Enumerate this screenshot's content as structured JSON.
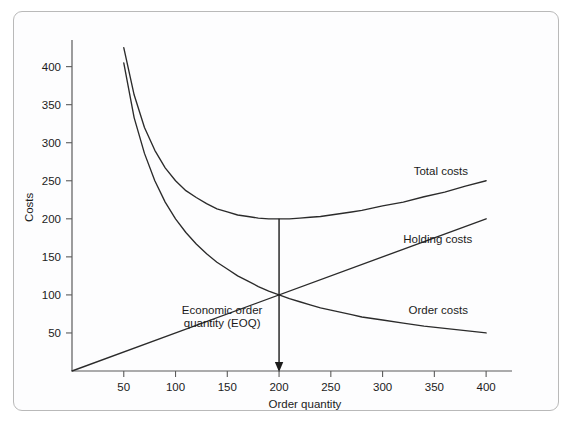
{
  "figure": {
    "frame_color": "#b9b9b9",
    "background": "#fdfdfe",
    "line_color": "#2b2b2b",
    "axis_color": "#5b5b5b"
  },
  "chart_data": {
    "type": "line",
    "title": "",
    "xlabel": "Order quantity",
    "ylabel": "Costs",
    "xlim": [
      0,
      425
    ],
    "ylim": [
      0,
      435
    ],
    "grid": false,
    "legend_position": "inline-right",
    "xticks": [
      50,
      100,
      150,
      200,
      250,
      300,
      350,
      400
    ],
    "xtick_labels": [
      "50",
      "100",
      "150",
      "200",
      "250",
      "300",
      "350",
      "400"
    ],
    "yticks": [
      50,
      100,
      150,
      200,
      250,
      300,
      350,
      400
    ],
    "ytick_labels": [
      "50",
      "100",
      "150",
      "200",
      "250",
      "300",
      "350",
      "400"
    ],
    "series": [
      {
        "name": "Total costs",
        "label": "Total costs",
        "label_x": 330,
        "label_y": 258,
        "x": [
          50,
          60,
          70,
          80,
          90,
          100,
          110,
          120,
          130,
          140,
          150,
          160,
          170,
          180,
          190,
          200,
          210,
          220,
          230,
          240,
          250,
          260,
          270,
          280,
          290,
          300,
          320,
          340,
          360,
          380,
          400
        ],
        "y": [
          425,
          363,
          320,
          290,
          267,
          250,
          237,
          228,
          220,
          213,
          209,
          205,
          203,
          201,
          200,
          200,
          200,
          201,
          202,
          203,
          205,
          207,
          209,
          211,
          214,
          217,
          222,
          229,
          235,
          243,
          250
        ]
      },
      {
        "name": "Holding costs",
        "label": "Holding costs",
        "label_x": 320,
        "label_y": 168,
        "x": [
          0,
          400
        ],
        "y": [
          0,
          200
        ]
      },
      {
        "name": "Order costs",
        "label": "Order costs",
        "label_x": 325,
        "label_y": 75,
        "x": [
          50,
          60,
          70,
          80,
          90,
          100,
          110,
          120,
          130,
          140,
          150,
          160,
          170,
          180,
          190,
          200,
          210,
          220,
          230,
          240,
          250,
          260,
          270,
          280,
          290,
          300,
          320,
          340,
          360,
          380,
          400
        ],
        "y": [
          405,
          333,
          286,
          250,
          222,
          200,
          182,
          167,
          154,
          143,
          134,
          125,
          118,
          111,
          105,
          100,
          95,
          91,
          87,
          83,
          80,
          77,
          74,
          71,
          69,
          67,
          63,
          59,
          56,
          53,
          50
        ]
      }
    ],
    "annotations": [
      {
        "name": "eoq-annotation",
        "text_line1": "Economic order",
        "text_line2": "quantity (EOQ)",
        "pointer_x": 200,
        "pointer_y_top": 200,
        "pointer_y_bottom": 0,
        "eoq_value": 200,
        "minimum_total_cost": 200,
        "crossing_point_cost": 100
      }
    ]
  }
}
